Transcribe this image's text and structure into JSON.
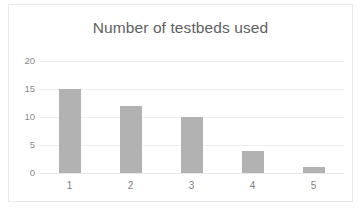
{
  "chart_data": {
    "type": "bar",
    "title": "Number of testbeds used",
    "xlabel": "",
    "ylabel": "",
    "categories": [
      "1",
      "2",
      "3",
      "4",
      "5"
    ],
    "values": [
      15,
      12,
      10,
      4,
      1
    ],
    "yticks": [
      0,
      5,
      10,
      15,
      20
    ],
    "ylim": [
      0,
      20
    ],
    "grid": true,
    "legend": false,
    "bar_color": "#b2b2b2",
    "title_color": "#616161",
    "gridline_color": "#f0f0f0",
    "tick_label_color": "#8a8a8a",
    "background_color": "#ffffff",
    "border_color": "#e8e8e8"
  }
}
